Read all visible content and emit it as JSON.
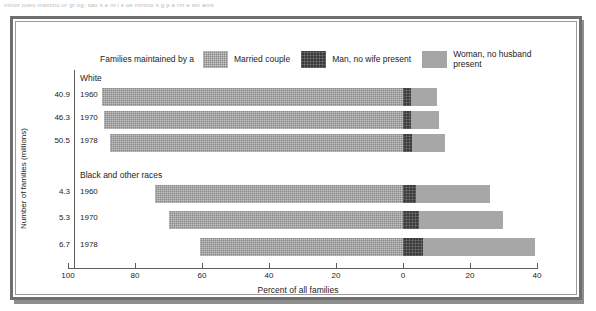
{
  "top_bleed_text": "minor  oceu maximo ur gr og;  sau  s  e  m i  s oe  mmmo  s       g                     p   a  rm    e  sm  ams",
  "legend": {
    "intro": "Families maintained by a",
    "items": [
      {
        "label": "Married couple",
        "swatch": "married-couple-swatch",
        "color": "#868686"
      },
      {
        "label": "Man, no wife present",
        "swatch": "man-no-wife-swatch",
        "color": "#3a3a3a"
      },
      {
        "label": "Woman, no husband\npresent",
        "swatch": "woman-no-husband-swatch",
        "color": "#a5a5a5"
      }
    ]
  },
  "axes": {
    "ylabel": "Number of families (millions)",
    "xlabel": "Percent of all families",
    "xticks": [
      "100",
      "80",
      "60",
      "40",
      "20",
      "0",
      "20",
      "40"
    ]
  },
  "groups": [
    {
      "name": "White",
      "rows": [
        {
          "year": "1960",
          "count": "40.9"
        },
        {
          "year": "1970",
          "count": "46.3"
        },
        {
          "year": "1978",
          "count": "50.5"
        }
      ]
    },
    {
      "name": "Black and other races",
      "rows": [
        {
          "year": "1960",
          "count": "4.3"
        },
        {
          "year": "1970",
          "count": "5.3"
        },
        {
          "year": "1978",
          "count": "6.7"
        }
      ]
    }
  ],
  "chart_data": {
    "type": "bar",
    "orientation": "horizontal-diverging",
    "title": "",
    "xlabel": "Percent of all families",
    "ylabel": "Number of families (millions)",
    "grid": false,
    "legend_position": "top",
    "xlim": [
      -100,
      45
    ],
    "xticks": [
      -100,
      -80,
      -60,
      -40,
      -20,
      0,
      20,
      40
    ],
    "xticklabels": [
      "100",
      "80",
      "60",
      "40",
      "20",
      "0",
      "20",
      "40"
    ],
    "series": [
      {
        "name": "Married couple",
        "color": "#868686",
        "direction": "left",
        "values": [
          90.0,
          89.2,
          87.4,
          74.0,
          70.0,
          60.5
        ]
      },
      {
        "name": "Man, no wife present",
        "color": "#3a3a3a",
        "direction": "right",
        "values": [
          2.5,
          2.5,
          2.6,
          4.0,
          4.8,
          6.0
        ]
      },
      {
        "name": "Woman, no husband present",
        "color": "#a5a5a5",
        "direction": "right",
        "values": [
          7.5,
          8.3,
          10.0,
          22.0,
          25.2,
          33.5
        ]
      }
    ],
    "categories": [
      "White 1960",
      "White 1970",
      "White 1978",
      "Black and other races 1960",
      "Black and other races 1970",
      "Black and other races 1978"
    ],
    "category_counts_millions": [
      40.9,
      46.3,
      50.5,
      4.3,
      5.3,
      6.7
    ]
  }
}
